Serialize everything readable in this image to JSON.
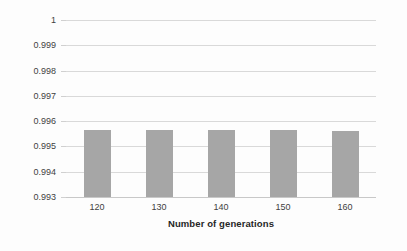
{
  "chart_data": {
    "type": "bar",
    "title": "",
    "xlabel": "Number of generations",
    "ylabel": "System reliability",
    "categories": [
      "120",
      "130",
      "140",
      "150",
      "160"
    ],
    "values": [
      0.99565,
      0.99565,
      0.99565,
      0.99564,
      0.99563
    ],
    "ylim": [
      0.993,
      1
    ],
    "ytick_labels": [
      "0.993",
      "0.994",
      "0.995",
      "0.996",
      "0.997",
      "0.998",
      "0.999",
      "1"
    ],
    "ytick_values": [
      0.993,
      0.994,
      0.995,
      0.996,
      0.997,
      0.998,
      0.999,
      1
    ],
    "grid": true,
    "legend": null,
    "series": [
      {
        "name": "System reliability",
        "values": [
          0.99565,
          0.99565,
          0.99565,
          0.99564,
          0.99563
        ]
      }
    ],
    "colors": {
      "bar": "#a6a6a6",
      "gridline": "#d9d9d9",
      "axis": "#c8c8c8",
      "text": "#3f3f3f",
      "title_text": "#262626",
      "background": "#fdfdfd"
    }
  }
}
